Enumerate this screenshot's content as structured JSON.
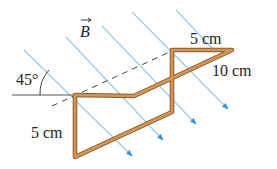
{
  "figure": {
    "field_label": "B",
    "angle_label": "45°",
    "labels": {
      "top_segment": "5 cm",
      "diagonal_segment": "10 cm",
      "left_segment": "5 cm"
    },
    "colors": {
      "wire": "#c8894a",
      "wire_outline": "#8a5a2b",
      "field_lines": "#7fb6d9",
      "arrowheads": "#3d8fd0",
      "dashed_line": "#333333",
      "reference_line": "#444444",
      "text": "#231f20"
    },
    "field_line_count": 5,
    "field_angle_deg": 45
  }
}
